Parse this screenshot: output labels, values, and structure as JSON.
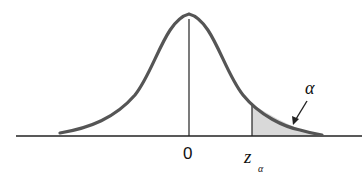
{
  "figure": {
    "type": "standard normal distribution with upper-tail shaded area",
    "labels": {
      "center": "0",
      "critical_value": "z",
      "critical_value_subscript": "α",
      "tail_area": "α"
    },
    "colors": {
      "curve": "#555555",
      "axis": "#222222",
      "shade": "#d8d8d8"
    }
  }
}
